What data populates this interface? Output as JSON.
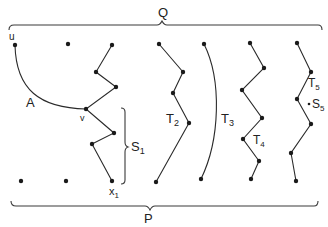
{
  "diagram": {
    "colors": {
      "background": "#ffffff",
      "ink": "#222222"
    },
    "braces": {
      "top": {
        "label": "Q"
      },
      "bottom": {
        "label": "P"
      },
      "side": {
        "label": "S",
        "subscript": "1"
      }
    },
    "labels": {
      "u": "u",
      "v": "v",
      "A": "A",
      "x1": {
        "base": "x",
        "sub": "1"
      },
      "T2": {
        "base": "T",
        "sub": "2"
      },
      "T3": {
        "base": "T",
        "sub": "3"
      },
      "T4": {
        "base": "T",
        "sub": "4"
      },
      "T5": {
        "base": "T",
        "sub": "5"
      },
      "S5": {
        "base": "S",
        "sub": "5"
      }
    },
    "paths": [
      {
        "name": "path-S1",
        "points": [
          [
            112,
            45
          ],
          [
            96,
            72
          ],
          [
            116,
            87
          ],
          [
            86,
            109
          ],
          [
            114,
            133
          ],
          [
            92,
            144
          ],
          [
            112,
            181
          ]
        ]
      },
      {
        "name": "path-T2",
        "points": [
          [
            159,
            44
          ],
          [
            183,
            72
          ],
          [
            173,
            93
          ],
          [
            189,
            123
          ],
          [
            156,
            182
          ]
        ]
      },
      {
        "name": "path-T4",
        "points": [
          [
            250,
            43
          ],
          [
            264,
            68
          ],
          [
            242,
            90
          ],
          [
            262,
            118
          ],
          [
            243,
            139
          ],
          [
            259,
            161
          ],
          [
            251,
            179
          ]
        ]
      },
      {
        "name": "path-T5",
        "points": [
          [
            297,
            43
          ],
          [
            311,
            72
          ],
          [
            297,
            99
          ],
          [
            311,
            124
          ],
          [
            291,
            153
          ],
          [
            296,
            181
          ]
        ]
      }
    ],
    "isolated_points": [
      [
        68,
        44
      ],
      [
        21,
        181
      ],
      [
        66,
        181
      ]
    ]
  }
}
